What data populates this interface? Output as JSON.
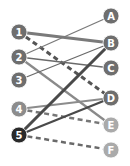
{
  "diagram": {
    "type": "bipartite-graph",
    "left_nodes": [
      {
        "id": "1",
        "label": "1",
        "x": 19,
        "y": 32,
        "color": "#6e6e6e"
      },
      {
        "id": "2",
        "label": "2",
        "x": 19,
        "y": 57,
        "color": "#6e6e6e"
      },
      {
        "id": "3",
        "label": "3",
        "x": 19,
        "y": 80,
        "color": "#6e6e6e"
      },
      {
        "id": "4",
        "label": "4",
        "x": 19,
        "y": 109,
        "color": "#8c8c8c"
      },
      {
        "id": "5",
        "label": "5",
        "x": 19,
        "y": 135,
        "color": "#2a2a2a"
      }
    ],
    "right_nodes": [
      {
        "id": "A",
        "label": "A",
        "x": 111,
        "y": 16,
        "color": "#6e6e6e"
      },
      {
        "id": "B",
        "label": "B",
        "x": 111,
        "y": 43,
        "color": "#6e6e6e"
      },
      {
        "id": "C",
        "label": "C",
        "x": 111,
        "y": 68,
        "color": "#6e6e6e"
      },
      {
        "id": "D",
        "label": "D",
        "x": 111,
        "y": 98,
        "color": "#6e6e6e"
      },
      {
        "id": "E",
        "label": "E",
        "x": 111,
        "y": 125,
        "color": "#aaaaaa"
      },
      {
        "id": "F",
        "label": "F",
        "x": 111,
        "y": 150,
        "color": "#aaaaaa"
      }
    ],
    "edges": [
      {
        "from": "1",
        "to": "B",
        "style": "solid",
        "width": 3,
        "color": "#7a7a7a"
      },
      {
        "from": "1",
        "to": "D",
        "style": "dashed",
        "width": 3,
        "color": "#555555"
      },
      {
        "from": "2",
        "to": "A",
        "style": "solid",
        "width": 1.3,
        "color": "#7a7a7a"
      },
      {
        "from": "2",
        "to": "C",
        "style": "solid",
        "width": 1.3,
        "color": "#6a6a6a"
      },
      {
        "from": "2",
        "to": "E",
        "style": "solid",
        "width": 2.2,
        "color": "#8a8a8a"
      },
      {
        "from": "3",
        "to": "B",
        "style": "solid",
        "width": 1.3,
        "color": "#6a6a6a"
      },
      {
        "from": "4",
        "to": "D",
        "style": "solid",
        "width": 2.2,
        "color": "#8c8c8c"
      },
      {
        "from": "4",
        "to": "E",
        "style": "dashed",
        "width": 2.5,
        "color": "#777777"
      },
      {
        "from": "5",
        "to": "B",
        "style": "solid",
        "width": 3,
        "color": "#4a4a4a"
      },
      {
        "from": "5",
        "to": "D",
        "style": "solid",
        "width": 2.2,
        "color": "#4a4a4a"
      },
      {
        "from": "5",
        "to": "F",
        "style": "dashed",
        "width": 2.5,
        "color": "#6a6a6a"
      }
    ],
    "node_radius": 8
  }
}
